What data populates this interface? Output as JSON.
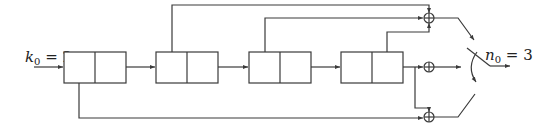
{
  "diagram": {
    "type": "convolutional-encoder",
    "input_label": {
      "var": "k",
      "sub": "0",
      "eq": " = 2"
    },
    "output_label": {
      "var": "n",
      "sub": "0",
      "eq": " = 3"
    },
    "num_registers": 4,
    "cells_per_register": 2,
    "num_adders": 3,
    "adder_symbol": "⊕",
    "components": {
      "registers": [
        "register-1",
        "register-2",
        "register-3",
        "register-4"
      ],
      "adders": [
        "adder-top",
        "adder-middle",
        "adder-bottom"
      ],
      "commutator": "output-switch"
    }
  }
}
